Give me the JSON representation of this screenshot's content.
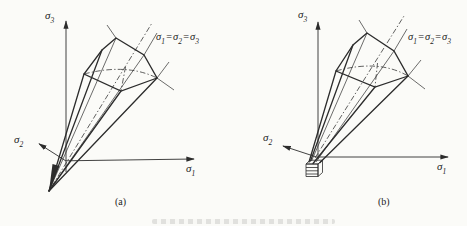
{
  "colors": {
    "background": "#fbfbf8",
    "line": "#2c2c2c",
    "text": "#222222"
  },
  "labels": {
    "sigma": "σ",
    "sub1": "1",
    "sub2": "2",
    "sub3": "3",
    "equals": "="
  },
  "panels": {
    "a": {
      "caption": "(a)"
    },
    "b": {
      "caption": "(b)"
    }
  }
}
